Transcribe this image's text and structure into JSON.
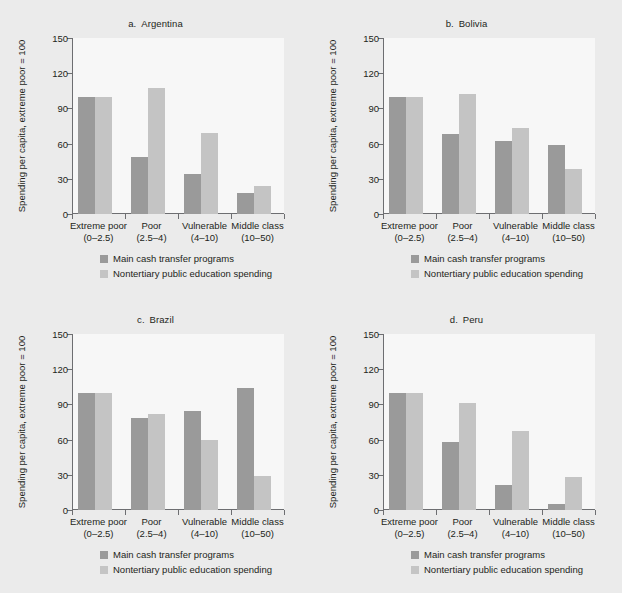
{
  "figure": {
    "background_color": "#ebebeb",
    "panel_background_color": "#f7f7f7",
    "axis_color": "#6d6e71"
  },
  "series_colors": {
    "main_cash_transfer_programs": "#9a9a9a",
    "nontertiary_public_education_spending": "#c4c4c4"
  },
  "legend": {
    "items": [
      {
        "label": "Main cash transfer programs",
        "color": "#9a9a9a"
      },
      {
        "label": "Nontertiary public education spending",
        "color": "#c4c4c4"
      }
    ]
  },
  "axis": {
    "ylabel": "Spending per capita, extreme poor = 100",
    "yticks": [
      "0",
      "30",
      "60",
      "90",
      "120",
      "150"
    ],
    "ymin": 0,
    "ymax": 150
  },
  "categories": [
    {
      "name": "Extreme poor",
      "range": "(0–2.5)"
    },
    {
      "name": "Poor",
      "range": "(2.5–4)"
    },
    {
      "name": "Vulnerable",
      "range": "(4–10)"
    },
    {
      "name": "Middle class",
      "range": "(10–50)"
    }
  ],
  "panels": [
    {
      "title": "a. Argentina"
    },
    {
      "title": "b. Bolivia"
    },
    {
      "title": "c. Brazil"
    },
    {
      "title": "d. Peru"
    }
  ],
  "chart_data": [
    {
      "type": "bar",
      "title": "a. Argentina",
      "xlabel": "",
      "ylabel": "Spending per capita, extreme poor = 100",
      "categories": [
        "Extreme poor (0–2.5)",
        "Poor (2.5–4)",
        "Vulnerable (4–10)",
        "Middle class (10–50)"
      ],
      "series": [
        {
          "name": "Main cash transfer programs",
          "values": [
            100,
            49,
            34,
            18
          ]
        },
        {
          "name": "Nontertiary public education spending",
          "values": [
            100,
            107,
            69,
            24
          ]
        }
      ],
      "ylim": [
        0,
        150
      ],
      "yticks": [
        0,
        30,
        60,
        90,
        120,
        150
      ],
      "grid": false,
      "legend_position": "below"
    },
    {
      "type": "bar",
      "title": "b. Bolivia",
      "xlabel": "",
      "ylabel": "Spending per capita, extreme poor = 100",
      "categories": [
        "Extreme poor (0–2.5)",
        "Poor (2.5–4)",
        "Vulnerable (4–10)",
        "Middle class (10–50)"
      ],
      "series": [
        {
          "name": "Main cash transfer programs",
          "values": [
            100,
            68,
            62,
            59
          ]
        },
        {
          "name": "Nontertiary public education spending",
          "values": [
            100,
            102,
            73,
            38
          ]
        }
      ],
      "ylim": [
        0,
        150
      ],
      "yticks": [
        0,
        30,
        60,
        90,
        120,
        150
      ],
      "grid": false,
      "legend_position": "below"
    },
    {
      "type": "bar",
      "title": "c. Brazil",
      "xlabel": "",
      "ylabel": "Spending per capita, extreme poor = 100",
      "categories": [
        "Extreme poor (0–2.5)",
        "Poor (2.5–4)",
        "Vulnerable (4–10)",
        "Middle class (10–50)"
      ],
      "series": [
        {
          "name": "Main cash transfer programs",
          "values": [
            100,
            78,
            84,
            104
          ]
        },
        {
          "name": "Nontertiary public education spending",
          "values": [
            100,
            82,
            60,
            29
          ]
        }
      ],
      "ylim": [
        0,
        150
      ],
      "yticks": [
        0,
        30,
        60,
        90,
        120,
        150
      ],
      "grid": false,
      "legend_position": "below"
    },
    {
      "type": "bar",
      "title": "d. Peru",
      "xlabel": "",
      "ylabel": "Spending per capita, extreme poor = 100",
      "categories": [
        "Extreme poor (0–2.5)",
        "Poor (2.5–4)",
        "Vulnerable (4–10)",
        "Middle class (10–50)"
      ],
      "series": [
        {
          "name": "Main cash transfer programs",
          "values": [
            100,
            58,
            21,
            5
          ]
        },
        {
          "name": "Nontertiary public education spending",
          "values": [
            100,
            91,
            67,
            28
          ]
        }
      ],
      "ylim": [
        0,
        150
      ],
      "yticks": [
        0,
        30,
        60,
        90,
        120,
        150
      ],
      "grid": false,
      "legend_position": "below"
    }
  ]
}
